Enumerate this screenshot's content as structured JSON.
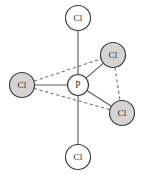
{
  "figure": {
    "background_color": "#ffffff",
    "width": 147,
    "height": 175
  },
  "style": {
    "shaded_fill": "#d6d4d2",
    "open_fill": "#ffffff",
    "outline_color": "#3a3a3a",
    "solid_bond_color": "#5b5b5b",
    "dashed_bond_color": "#6e6e6e"
  },
  "chart_data": {
    "type": "diagram",
    "xlabel": "",
    "ylabel": "",
    "xlim": [
      0,
      147
    ],
    "ylim": [
      0,
      175
    ],
    "grid": false,
    "legend": "none",
    "atoms": [
      {
        "id": "p-center",
        "label": "P",
        "x": 78,
        "y": 85,
        "r": 10.5,
        "fill": "open",
        "role": "central"
      },
      {
        "id": "cl-axial-top",
        "label": "Cl",
        "x": 78,
        "y": 18,
        "r": 12.5,
        "fill": "open",
        "role": "axial"
      },
      {
        "id": "cl-axial-bottom",
        "label": "Cl",
        "x": 78,
        "y": 157,
        "r": 12.5,
        "fill": "open",
        "role": "axial"
      },
      {
        "id": "cl-equatorial-left",
        "label": "Cl",
        "x": 22,
        "y": 85,
        "r": 12.5,
        "fill": "shaded",
        "role": "equatorial"
      },
      {
        "id": "cl-equatorial-upper-right",
        "label": "Cl",
        "x": 113,
        "y": 55,
        "r": 12.5,
        "fill": "shaded",
        "role": "equatorial"
      },
      {
        "id": "cl-equatorial-lower-right",
        "label": "Cl",
        "x": 122,
        "y": 113,
        "r": 12.5,
        "fill": "shaded",
        "role": "equatorial"
      }
    ],
    "bonds": [
      {
        "id": "bond-p-axial-top",
        "from": "p-center",
        "to": "cl-axial-top",
        "style": "solid"
      },
      {
        "id": "bond-p-axial-bottom",
        "from": "p-center",
        "to": "cl-axial-bottom",
        "style": "solid"
      },
      {
        "id": "bond-p-eq-left",
        "from": "p-center",
        "to": "cl-equatorial-left",
        "style": "solid"
      },
      {
        "id": "bond-p-eq-upper-right",
        "from": "p-center",
        "to": "cl-equatorial-upper-right",
        "style": "solid"
      },
      {
        "id": "bond-p-eq-lower-right",
        "from": "p-center",
        "to": "cl-equatorial-lower-right",
        "style": "solid"
      },
      {
        "id": "guide-eq-left-upper-right",
        "from": "cl-equatorial-left",
        "to": "cl-equatorial-upper-right",
        "style": "dashed"
      },
      {
        "id": "guide-eq-upper-right-lower-right",
        "from": "cl-equatorial-upper-right",
        "to": "cl-equatorial-lower-right",
        "style": "dashed"
      },
      {
        "id": "guide-eq-lower-right-left",
        "from": "cl-equatorial-lower-right",
        "to": "cl-equatorial-left",
        "style": "dashed"
      }
    ],
    "labels": {
      "central_atom": "P",
      "ligand_atom": "Cl",
      "axial_count": 2,
      "equatorial_count": 3
    }
  }
}
